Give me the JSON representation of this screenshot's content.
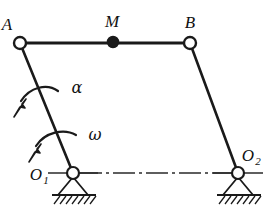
{
  "figure": {
    "type": "four-bar-linkage-kinematic-diagram",
    "background_color": "#ffffff",
    "line_color": "#1a1a1a"
  },
  "labels": {
    "point_a": "A",
    "point_m": "M",
    "point_b": "B",
    "pivot_o1_base": "O",
    "pivot_o1_sub": "1",
    "pivot_o2_base": "O",
    "pivot_o2_sub": "2",
    "angular_acceleration": "α",
    "angular_velocity": "ω"
  },
  "joints": [
    {
      "name": "A",
      "x": 20,
      "y": 43,
      "style": "hollow"
    },
    {
      "name": "M",
      "x": 113,
      "y": 42,
      "style": "filled"
    },
    {
      "name": "B",
      "x": 190,
      "y": 43,
      "style": "hollow"
    },
    {
      "name": "O1",
      "x": 73,
      "y": 173,
      "style": "hollow"
    },
    {
      "name": "O2",
      "x": 238,
      "y": 173,
      "style": "hollow"
    }
  ],
  "links": [
    {
      "name": "coupler-AB",
      "from": "A",
      "to": "B"
    },
    {
      "name": "crank-A-O1",
      "from": "A",
      "to": "O1"
    },
    {
      "name": "rocker-B-O2",
      "from": "B",
      "to": "O2"
    }
  ],
  "supports": [
    {
      "name": "O1",
      "x": 73,
      "y": 173,
      "type": "pinned-hatched"
    },
    {
      "name": "O2",
      "x": 238,
      "y": 173,
      "type": "pinned-hatched"
    }
  ],
  "centerline": {
    "name": "ground-centerline",
    "x1": 73,
    "x2": 238,
    "y": 173,
    "style": "dash-dot"
  },
  "arrows": [
    {
      "name": "alpha",
      "label": "α",
      "direction": "counterclockwise-down-left"
    },
    {
      "name": "omega",
      "label": "ω",
      "direction": "counterclockwise-down-left"
    }
  ]
}
